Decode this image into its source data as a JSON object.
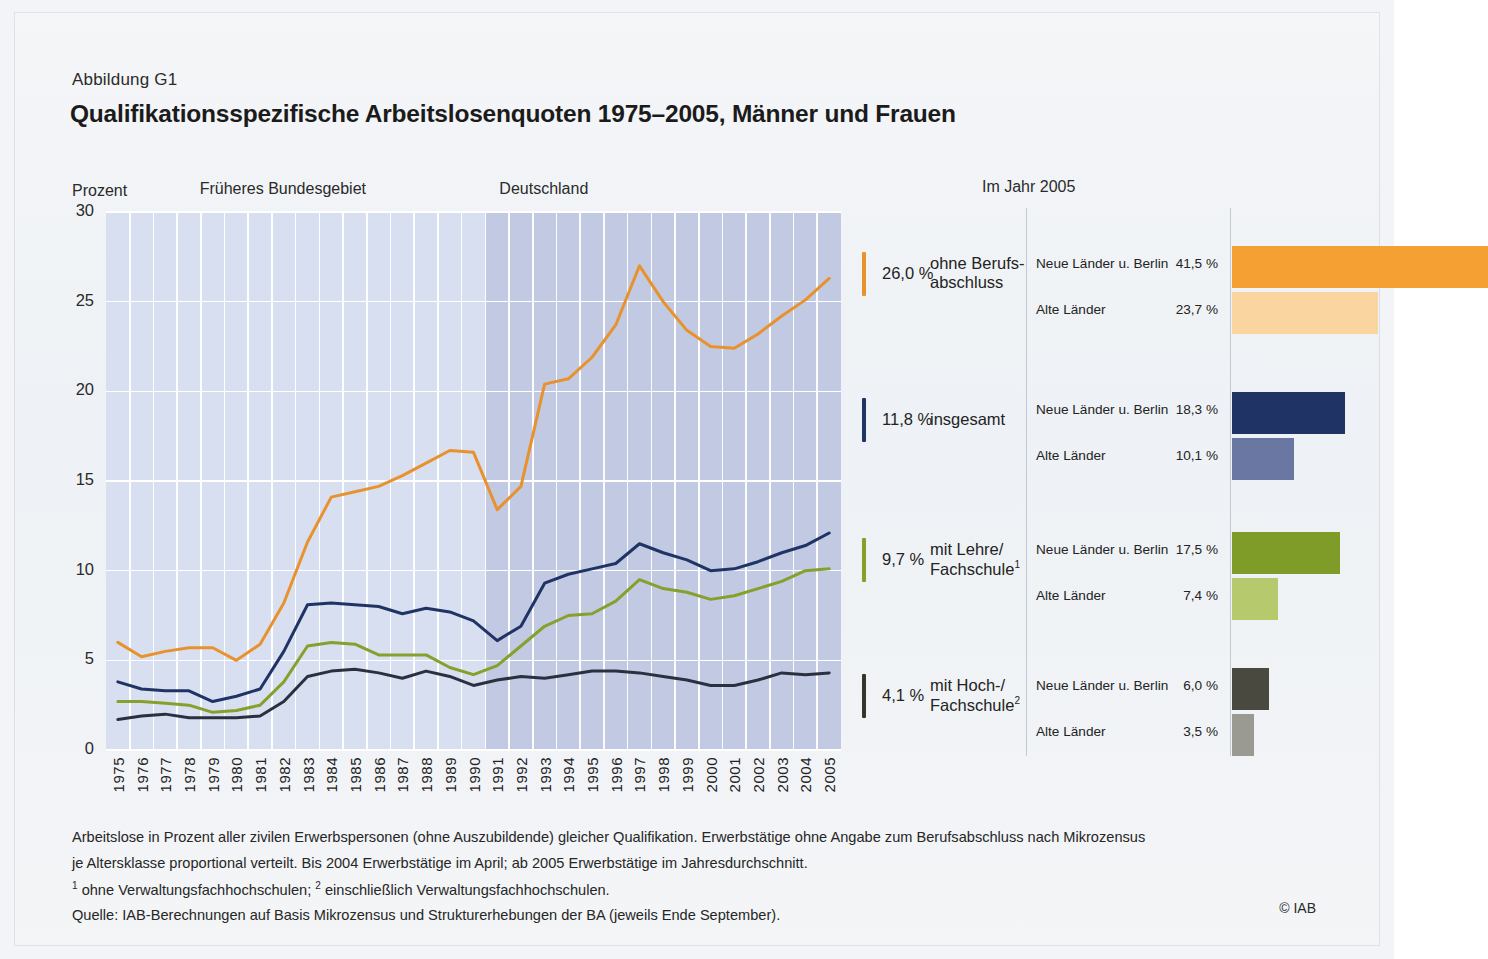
{
  "figure": {
    "number": "Abbildung G1",
    "title": "Qualifikationsspezifische Arbeitslosenquoten 1975–2005, Männer und Frauen",
    "axis_unit": "Prozent",
    "region_left": "Früheres Bundesgebiet",
    "region_right": "Deutschland",
    "panel_right_title": "Im Jahr 2005",
    "copyright": "© IAB"
  },
  "notes": {
    "line1": "Arbeitslose in Prozent aller zivilen Erwerbspersonen (ohne Auszubildende) gleicher Qualifikation. Erwerbstätige ohne Angabe zum Berufsabschluss nach Mikrozensus",
    "line2": "je Altersklasse proportional verteilt. Bis 2004 Erwerbstätige im April; ab 2005 Erwerbstätige im Jahresdurchschnitt.",
    "line3_a": "ohne Verwaltungsfachhochschulen;",
    "line3_b": "einschließlich Verwaltungsfachhochschulen.",
    "line3_sup1": "1",
    "line3_sup2": "2",
    "source": "Quelle: IAB-Berechnungen auf Basis Mikrozensus und Strukturerhebungen der BA (jeweils Ende September)."
  },
  "legend": [
    {
      "value": "26,0 %",
      "name_line1": "ohne Berufs-",
      "name_line2": "abschluss",
      "color": "#E8922E",
      "rows": [
        {
          "label": "Neue Länder u. Berlin",
          "value": "41,5 %",
          "num": 41.5,
          "color": "#F5A033"
        },
        {
          "label": "Alte Länder",
          "value": "23,7 %",
          "num": 23.7,
          "color": "#FBD5A0"
        }
      ]
    },
    {
      "value": "11,8 %",
      "name_line1": "insgesamt",
      "name_line2": "",
      "color": "#1F3465",
      "rows": [
        {
          "label": "Neue Länder u. Berlin",
          "value": "18,3 %",
          "num": 18.3,
          "color": "#1F3465"
        },
        {
          "label": "Alte Länder",
          "value": "10,1 %",
          "num": 10.1,
          "color": "#6A77A3"
        }
      ]
    },
    {
      "value": "9,7 %",
      "name_line1": "mit Lehre/",
      "name_line2": "Fachschule",
      "name_sup": "1",
      "color": "#87A02C",
      "rows": [
        {
          "label": "Neue Länder u. Berlin",
          "value": "17,5 %",
          "num": 17.5,
          "color": "#7F9B28"
        },
        {
          "label": "Alte Länder",
          "value": "7,4 %",
          "num": 7.4,
          "color": "#B6C96D"
        }
      ]
    },
    {
      "value": "4,1 %",
      "name_line1": "mit Hoch-/",
      "name_line2": "Fachschule",
      "name_sup": "2",
      "color": "#35352F",
      "rows": [
        {
          "label": "Neue Länder u. Berlin",
          "value": "6,0 %",
          "num": 6.0,
          "color": "#49493F"
        },
        {
          "label": "Alte Länder",
          "value": "3,5 %",
          "num": 3.5,
          "color": "#9A9A93"
        }
      ]
    }
  ],
  "chart_data": {
    "type": "line",
    "title": "Qualifikationsspezifische Arbeitslosenquoten 1975–2005, Männer und Frauen",
    "xlabel": "",
    "ylabel": "Prozent",
    "ylim": [
      0,
      30
    ],
    "yticks": [
      0,
      5,
      10,
      15,
      20,
      25,
      30
    ],
    "ytick_labels": [
      "0",
      "5",
      "10",
      "15",
      "20",
      "25",
      "30"
    ],
    "grid": true,
    "legend_position": "right",
    "annotations": [
      {
        "text": "Früheres Bundesgebiet",
        "span": [
          1975,
          1990
        ]
      },
      {
        "text": "Deutschland",
        "span": [
          1991,
          2005
        ]
      }
    ],
    "x": [
      1975,
      1976,
      1977,
      1978,
      1979,
      1980,
      1981,
      1982,
      1983,
      1984,
      1985,
      1986,
      1987,
      1988,
      1989,
      1990,
      1991,
      1992,
      1993,
      1994,
      1995,
      1996,
      1997,
      1998,
      1999,
      2000,
      2001,
      2002,
      2003,
      2004,
      2005
    ],
    "categories": [
      "1975",
      "1976",
      "1977",
      "1978",
      "1979",
      "1980",
      "1981",
      "1982",
      "1983",
      "1984",
      "1985",
      "1986",
      "1987",
      "1988",
      "1989",
      "1990",
      "1991",
      "1992",
      "1993",
      "1994",
      "1995",
      "1996",
      "1997",
      "1998",
      "1999",
      "2000",
      "2001",
      "2002",
      "2003",
      "2004",
      "2005"
    ],
    "series": [
      {
        "name": "ohne Berufsabschluss",
        "color": "#E8922E",
        "values": [
          6.0,
          5.2,
          5.5,
          5.7,
          5.7,
          5.0,
          5.9,
          8.2,
          11.6,
          14.1,
          14.4,
          14.7,
          15.3,
          16.0,
          16.7,
          16.6,
          13.4,
          14.7,
          20.4,
          20.7,
          21.9,
          23.7,
          27.0,
          25.0,
          23.4,
          22.5,
          22.4,
          23.2,
          24.2,
          25.1,
          26.3
        ]
      },
      {
        "name": "insgesamt",
        "color": "#1F3465",
        "values": [
          3.8,
          3.4,
          3.3,
          3.3,
          2.7,
          3.0,
          3.4,
          5.5,
          8.1,
          8.2,
          8.1,
          8.0,
          7.6,
          7.9,
          7.7,
          7.2,
          6.1,
          6.9,
          9.3,
          9.8,
          10.1,
          10.4,
          11.5,
          11.0,
          10.6,
          10.0,
          10.1,
          10.5,
          11.0,
          11.4,
          12.1
        ]
      },
      {
        "name": "mit Lehre/Fachschule",
        "color": "#87A02C",
        "values": [
          2.7,
          2.7,
          2.6,
          2.5,
          2.1,
          2.2,
          2.5,
          3.8,
          5.8,
          6.0,
          5.9,
          5.3,
          5.3,
          5.3,
          4.6,
          4.2,
          4.7,
          5.8,
          6.9,
          7.5,
          7.6,
          8.3,
          9.5,
          9.0,
          8.8,
          8.4,
          8.6,
          9.0,
          9.4,
          10.0,
          10.1
        ]
      },
      {
        "name": "mit Hoch-/Fachschule",
        "color": "#2B3040",
        "values": [
          1.7,
          1.9,
          2.0,
          1.8,
          1.8,
          1.8,
          1.9,
          2.7,
          4.1,
          4.4,
          4.5,
          4.3,
          4.0,
          4.4,
          4.1,
          3.6,
          3.9,
          4.1,
          4.0,
          4.2,
          4.4,
          4.4,
          4.3,
          4.1,
          3.9,
          3.6,
          3.6,
          3.9,
          4.3,
          4.2,
          4.3
        ]
      }
    ],
    "side_bars": {
      "type": "bar",
      "title": "Im Jahr 2005",
      "xlim": [
        0,
        45
      ],
      "groups": [
        {
          "name": "ohne Berufsabschluss",
          "bars": [
            {
              "label": "Neue Länder u. Berlin",
              "value": 41.5
            },
            {
              "label": "Alte Länder",
              "value": 23.7
            }
          ]
        },
        {
          "name": "insgesamt",
          "bars": [
            {
              "label": "Neue Länder u. Berlin",
              "value": 18.3
            },
            {
              "label": "Alte Länder",
              "value": 10.1
            }
          ]
        },
        {
          "name": "mit Lehre/Fachschule",
          "bars": [
            {
              "label": "Neue Länder u. Berlin",
              "value": 17.5
            },
            {
              "label": "Alte Länder",
              "value": 7.4
            }
          ]
        },
        {
          "name": "mit Hoch-/Fachschule",
          "bars": [
            {
              "label": "Neue Länder u. Berlin",
              "value": 6.0
            },
            {
              "label": "Alte Länder",
              "value": 3.5
            }
          ]
        }
      ]
    }
  }
}
